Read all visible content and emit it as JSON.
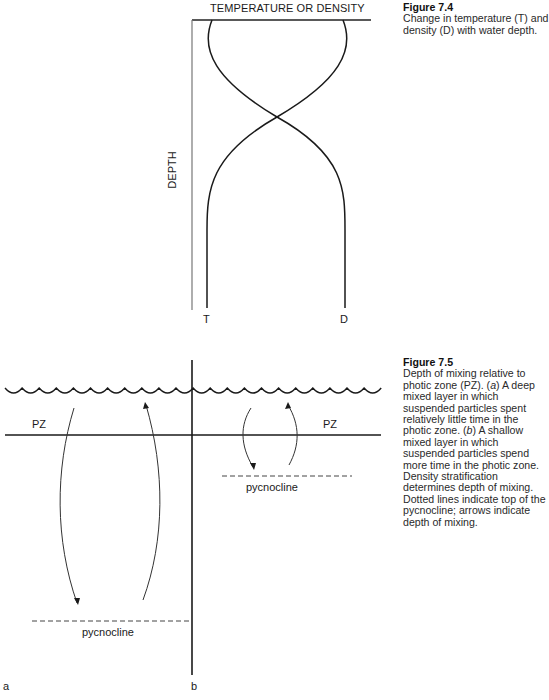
{
  "figure_7_4": {
    "x_axis_title": "TEMPERATURE OR DENSITY",
    "y_axis_title": "DEPTH",
    "curves": [
      {
        "label": "T",
        "name": "temperature"
      },
      {
        "label": "D",
        "name": "density"
      }
    ],
    "caption": {
      "number": "Figure 7.4",
      "text": "Change in temperature (T) and density (D) with water depth."
    }
  },
  "figure_7_5": {
    "panels": [
      {
        "id": "a",
        "label": "a",
        "zone_label": "PZ",
        "pycnocline_label": "pycnocline",
        "mixing": "deep"
      },
      {
        "id": "b",
        "label": "b",
        "zone_label": "PZ",
        "pycnocline_label": "pycnocline",
        "mixing": "shallow"
      }
    ],
    "caption": {
      "number": "Figure 7.5",
      "text_parts": [
        "Depth of mixing relative to photic zone (PZ). (",
        "a",
        ") A deep mixed layer in which suspended particles spent relatively little time in the photic zone. (",
        "b",
        ") A shallow mixed layer in which suspended particles spend more time in the photic zone. Density stratification determines depth of mixing. Dotted lines indicate top of the pycnocline; arrows indicate depth of mixing."
      ]
    }
  },
  "colors": {
    "line": "#1a1a1a",
    "axis": "#555555",
    "text": "#1a1a1a"
  }
}
